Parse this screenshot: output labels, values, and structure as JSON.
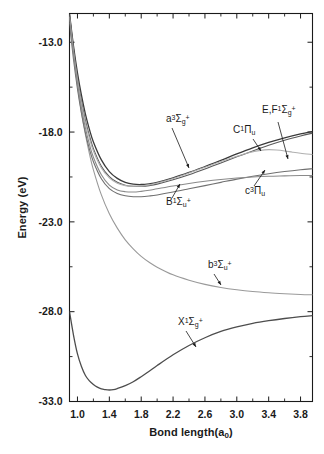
{
  "chart_data": {
    "type": "line",
    "title": "",
    "xlabel": "Bond length(a",
    "xlabel_sub": "0",
    "xlabel_tail": ")",
    "ylabel": "Energy (eV)",
    "xlim": [
      0.9,
      3.95
    ],
    "ylim": [
      -33.0,
      -11.4
    ],
    "xticks": [
      "1.0",
      "1.4",
      "1.8",
      "2.2",
      "2.6",
      "3.0",
      "3.4",
      "3.8"
    ],
    "xtick_values": [
      1.0,
      1.4,
      1.8,
      2.2,
      2.6,
      3.0,
      3.4,
      3.8
    ],
    "xminor_step": 0.2,
    "yticks": [
      "-13.0",
      "-18.0",
      "-23.0",
      "-28.0",
      "-33.0"
    ],
    "ytick_values": [
      -13.0,
      -18.0,
      -23.0,
      -28.0,
      -33.0
    ],
    "yminor_step": 2.5,
    "grid": false,
    "legend": "none (inline curve annotations)",
    "frame": "full box, ticks inward on all four sides",
    "series": [
      {
        "name": "X1Sigma_g+",
        "label_html": "X<sup>1</sup>Σ<sub>g</sub><sup>+</sup>",
        "color": "#4d4d4d",
        "width": 1.3,
        "points": [
          [
            0.9,
            -28.0
          ],
          [
            0.95,
            -29.3
          ],
          [
            1.0,
            -30.35
          ],
          [
            1.05,
            -31.05
          ],
          [
            1.1,
            -31.55
          ],
          [
            1.15,
            -31.85
          ],
          [
            1.2,
            -32.05
          ],
          [
            1.25,
            -32.2
          ],
          [
            1.3,
            -32.3
          ],
          [
            1.35,
            -32.34
          ],
          [
            1.4,
            -32.36
          ],
          [
            1.45,
            -32.34
          ],
          [
            1.5,
            -32.28
          ],
          [
            1.6,
            -32.12
          ],
          [
            1.7,
            -31.9
          ],
          [
            1.8,
            -31.62
          ],
          [
            1.9,
            -31.32
          ],
          [
            2.0,
            -31.0
          ],
          [
            2.2,
            -30.4
          ],
          [
            2.4,
            -29.88
          ],
          [
            2.6,
            -29.45
          ],
          [
            2.8,
            -29.1
          ],
          [
            3.0,
            -28.85
          ],
          [
            3.2,
            -28.65
          ],
          [
            3.4,
            -28.5
          ],
          [
            3.6,
            -28.38
          ],
          [
            3.8,
            -28.28
          ],
          [
            3.95,
            -28.22
          ]
        ]
      },
      {
        "name": "b3Sigma_u+",
        "label_html": "b<sup>3</sup>Σ<sub>u</sub><sup>+</sup>",
        "color": "#9a9a9a",
        "width": 1.1,
        "points": [
          [
            0.9,
            -11.5
          ],
          [
            0.95,
            -13.6
          ],
          [
            1.0,
            -15.4
          ],
          [
            1.05,
            -16.9
          ],
          [
            1.1,
            -18.15
          ],
          [
            1.15,
            -19.2
          ],
          [
            1.2,
            -20.1
          ],
          [
            1.3,
            -21.5
          ],
          [
            1.4,
            -22.55
          ],
          [
            1.5,
            -23.35
          ],
          [
            1.6,
            -24.0
          ],
          [
            1.7,
            -24.5
          ],
          [
            1.8,
            -24.92
          ],
          [
            1.9,
            -25.25
          ],
          [
            2.0,
            -25.52
          ],
          [
            2.2,
            -25.95
          ],
          [
            2.4,
            -26.25
          ],
          [
            2.6,
            -26.48
          ],
          [
            2.8,
            -26.65
          ],
          [
            3.0,
            -26.78
          ],
          [
            3.2,
            -26.88
          ],
          [
            3.4,
            -26.95
          ],
          [
            3.6,
            -27.0
          ],
          [
            3.8,
            -27.04
          ],
          [
            3.95,
            -27.06
          ]
        ]
      },
      {
        "name": "a3Sigma_g+",
        "label_html": "a<sup>3</sup>Σ<sub>g</sub><sup>+</sup>",
        "color": "#3a3a3a",
        "width": 1.3,
        "points": [
          [
            0.9,
            -11.4
          ],
          [
            0.95,
            -13.2
          ],
          [
            1.0,
            -14.7
          ],
          [
            1.05,
            -15.95
          ],
          [
            1.1,
            -17.0
          ],
          [
            1.15,
            -17.85
          ],
          [
            1.2,
            -18.55
          ],
          [
            1.3,
            -19.55
          ],
          [
            1.4,
            -20.2
          ],
          [
            1.5,
            -20.58
          ],
          [
            1.6,
            -20.8
          ],
          [
            1.7,
            -20.9
          ],
          [
            1.8,
            -20.92
          ],
          [
            1.9,
            -20.88
          ],
          [
            2.0,
            -20.8
          ],
          [
            2.2,
            -20.55
          ],
          [
            2.4,
            -20.25
          ],
          [
            2.6,
            -19.92
          ],
          [
            2.8,
            -19.58
          ],
          [
            3.0,
            -19.22
          ],
          [
            3.2,
            -18.88
          ],
          [
            3.4,
            -18.58
          ],
          [
            3.6,
            -18.32
          ],
          [
            3.8,
            -18.1
          ],
          [
            3.95,
            -17.96
          ]
        ]
      },
      {
        "name": "C1Pi_u",
        "label_html": "C<sup>1</sup>Π<sub>u</sub>",
        "color": "#5a5a5a",
        "width": 1.1,
        "points": [
          [
            0.9,
            -11.45
          ],
          [
            0.95,
            -13.35
          ],
          [
            1.0,
            -14.95
          ],
          [
            1.05,
            -16.25
          ],
          [
            1.1,
            -17.35
          ],
          [
            1.15,
            -18.2
          ],
          [
            1.2,
            -18.92
          ],
          [
            1.3,
            -19.9
          ],
          [
            1.4,
            -20.48
          ],
          [
            1.5,
            -20.8
          ],
          [
            1.6,
            -20.96
          ],
          [
            1.7,
            -21.02
          ],
          [
            1.8,
            -21.02
          ],
          [
            1.9,
            -20.98
          ],
          [
            2.0,
            -20.9
          ],
          [
            2.2,
            -20.66
          ],
          [
            2.4,
            -20.38
          ],
          [
            2.6,
            -20.06
          ],
          [
            2.8,
            -19.72
          ],
          [
            3.0,
            -19.38
          ],
          [
            3.2,
            -19.05
          ],
          [
            3.4,
            -18.74
          ],
          [
            3.6,
            -18.46
          ],
          [
            3.8,
            -18.22
          ],
          [
            3.95,
            -18.06
          ]
        ]
      },
      {
        "name": "EF1Sigma_g+",
        "label_html": "E,F<sup>1</sup>Σ<sub>g</sub><sup>+</sup>",
        "color": "#b0b0b0",
        "width": 1.1,
        "points": [
          [
            0.9,
            -11.6
          ],
          [
            0.95,
            -13.5
          ],
          [
            1.0,
            -15.1
          ],
          [
            1.05,
            -16.4
          ],
          [
            1.1,
            -17.5
          ],
          [
            1.15,
            -18.35
          ],
          [
            1.2,
            -19.05
          ],
          [
            1.3,
            -20.0
          ],
          [
            1.4,
            -20.55
          ],
          [
            1.5,
            -20.85
          ],
          [
            1.6,
            -20.98
          ],
          [
            1.7,
            -21.02
          ],
          [
            1.8,
            -21.0
          ],
          [
            1.9,
            -20.94
          ],
          [
            2.0,
            -20.84
          ],
          [
            2.2,
            -20.58
          ],
          [
            2.4,
            -20.28
          ],
          [
            2.6,
            -19.96
          ],
          [
            2.8,
            -19.64
          ],
          [
            3.0,
            -19.35
          ],
          [
            3.15,
            -19.15
          ],
          [
            3.3,
            -19.02
          ],
          [
            3.4,
            -18.98
          ],
          [
            3.5,
            -19.0
          ],
          [
            3.6,
            -19.05
          ],
          [
            3.7,
            -19.12
          ],
          [
            3.8,
            -19.18
          ],
          [
            3.95,
            -19.25
          ]
        ]
      },
      {
        "name": "B1Sigma_u+",
        "label_html": "B<sup>1</sup>Σ<sub>u</sub><sup>+</sup>",
        "color": "#707070",
        "width": 1.1,
        "points": [
          [
            0.9,
            -11.95
          ],
          [
            0.95,
            -13.95
          ],
          [
            1.0,
            -15.6
          ],
          [
            1.05,
            -16.95
          ],
          [
            1.1,
            -18.05
          ],
          [
            1.15,
            -18.95
          ],
          [
            1.2,
            -19.65
          ],
          [
            1.3,
            -20.6
          ],
          [
            1.4,
            -21.15
          ],
          [
            1.5,
            -21.42
          ],
          [
            1.6,
            -21.55
          ],
          [
            1.7,
            -21.6
          ],
          [
            1.8,
            -21.6
          ],
          [
            1.9,
            -21.56
          ],
          [
            2.0,
            -21.5
          ],
          [
            2.2,
            -21.34
          ],
          [
            2.4,
            -21.16
          ],
          [
            2.6,
            -20.98
          ],
          [
            2.8,
            -20.8
          ],
          [
            3.0,
            -20.62
          ],
          [
            3.2,
            -20.46
          ],
          [
            3.4,
            -20.32
          ],
          [
            3.6,
            -20.2
          ],
          [
            3.8,
            -20.1
          ],
          [
            3.95,
            -20.04
          ]
        ]
      },
      {
        "name": "c3Pi_u",
        "label_html": "c<sup>3</sup>Π<sub>u</sub>",
        "color": "#8a8a8a",
        "width": 1.1,
        "points": [
          [
            0.9,
            -11.7
          ],
          [
            0.95,
            -13.65
          ],
          [
            1.0,
            -15.3
          ],
          [
            1.05,
            -16.65
          ],
          [
            1.1,
            -17.78
          ],
          [
            1.15,
            -18.68
          ],
          [
            1.2,
            -19.4
          ],
          [
            1.3,
            -20.38
          ],
          [
            1.4,
            -20.95
          ],
          [
            1.5,
            -21.22
          ],
          [
            1.6,
            -21.32
          ],
          [
            1.7,
            -21.34
          ],
          [
            1.8,
            -21.3
          ],
          [
            1.9,
            -21.24
          ],
          [
            2.0,
            -21.16
          ],
          [
            2.2,
            -21.0
          ],
          [
            2.4,
            -20.86
          ],
          [
            2.6,
            -20.74
          ],
          [
            2.8,
            -20.64
          ],
          [
            3.0,
            -20.56
          ],
          [
            3.2,
            -20.5
          ],
          [
            3.4,
            -20.46
          ],
          [
            3.6,
            -20.44
          ],
          [
            3.8,
            -20.42
          ],
          [
            3.95,
            -20.42
          ]
        ]
      }
    ],
    "annotations": [
      {
        "key": "a3sg",
        "label_html": "a<sup>3</sup>Σ<sub>g</sub><sup>+</sup>",
        "text_x": 166,
        "text_y": 122,
        "leader": [
          [
            172,
            128
          ],
          [
            189,
            168
          ]
        ]
      },
      {
        "key": "C1Pu",
        "label_html": "C<sup>1</sup>Π<sub>u</sub>",
        "text_x": 233,
        "text_y": 133,
        "leader": [
          [
            253,
            139
          ],
          [
            261,
            151
          ]
        ]
      },
      {
        "key": "EF1Sg",
        "label_html": "E,F<sup>1</sup>Σ<sub>g</sub><sup>+</sup>",
        "text_x": 262,
        "text_y": 113,
        "leader": [
          [
            278,
            122
          ],
          [
            288,
            159
          ]
        ]
      },
      {
        "key": "B1Su",
        "label_html": "B<sup>1</sup>Σ<sub>u</sub><sup>+</sup>",
        "text_x": 166,
        "text_y": 205,
        "leader": [
          [
            172,
            198
          ],
          [
            180,
            184
          ]
        ]
      },
      {
        "key": "c3Pu",
        "label_html": "c<sup>3</sup>Π<sub>u</sub>",
        "text_x": 245,
        "text_y": 194,
        "leader": [
          [
            254,
            186
          ],
          [
            265,
            170
          ]
        ]
      },
      {
        "key": "b3Su",
        "label_html": "b<sup>3</sup>Σ<sub>u</sub><sup>+</sup>",
        "text_x": 208,
        "text_y": 268,
        "leader": [
          [
            214,
            274
          ],
          [
            221,
            285
          ]
        ]
      },
      {
        "key": "X1Sg",
        "label_html": "X<sup>1</sup>Σ<sub>g</sub><sup>+</sup>",
        "text_x": 178,
        "text_y": 325,
        "leader": [
          [
            186,
            331
          ],
          [
            196,
            347
          ]
        ]
      }
    ]
  }
}
